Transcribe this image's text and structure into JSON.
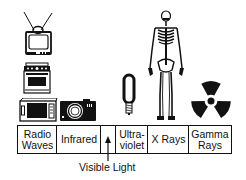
{
  "diagram": {
    "bands": [
      {
        "label": "Radio\nWaves",
        "line1": "Radio",
        "line2": "Waves"
      },
      {
        "label": "Infrared",
        "line1": "Infrared",
        "line2": ""
      },
      {
        "label": "",
        "line1": "",
        "line2": ""
      },
      {
        "label": "Ultra-\nviolet",
        "line1": "Ultra-",
        "line2": "violet"
      },
      {
        "label": "X Rays",
        "line1": "X Rays",
        "line2": ""
      },
      {
        "label": "Gamma\nRays",
        "line1": "Gamma",
        "line2": "Rays"
      }
    ],
    "visible_light_label": "Visible Light",
    "icons": [
      {
        "name": "television-icon",
        "band": "Radio Waves"
      },
      {
        "name": "stove-icon",
        "band": "Radio Waves"
      },
      {
        "name": "microwave-icon",
        "band": "Radio Waves"
      },
      {
        "name": "camera-icon",
        "band": "Infrared"
      },
      {
        "name": "blacklight-bulb-icon",
        "band": "Ultraviolet"
      },
      {
        "name": "skeleton-icon",
        "band": "X Rays"
      },
      {
        "name": "radiation-symbol-icon",
        "band": "Gamma Rays"
      }
    ]
  }
}
